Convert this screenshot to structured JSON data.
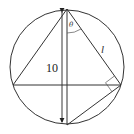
{
  "diagram": {
    "type": "geometry",
    "labels": {
      "diameter_length": "10",
      "angle": "θ",
      "side": "l"
    },
    "colors": {
      "stroke": "#333333",
      "background": "#ffffff"
    }
  }
}
